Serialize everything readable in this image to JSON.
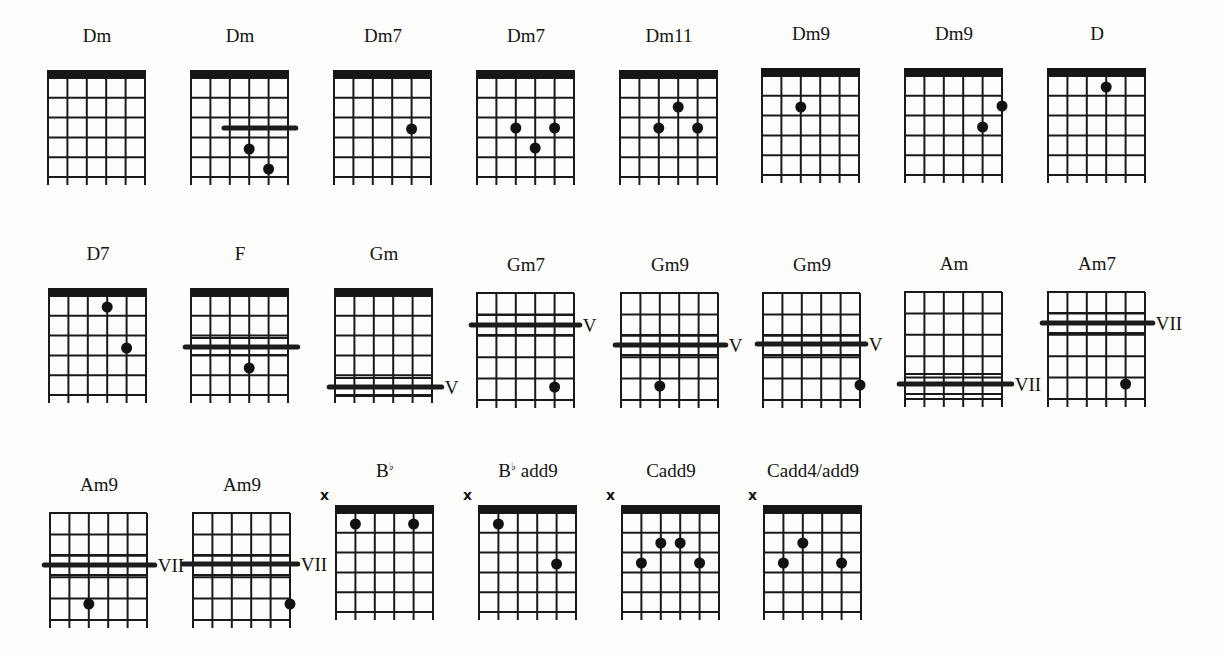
{
  "page": {
    "grid": {
      "width": 97,
      "height": 115,
      "strings": 6,
      "string_gap": 19.4,
      "fret_gap": 19.5,
      "nut_height": 8,
      "stub": 8
    }
  },
  "chords": [
    {
      "id": "dm-1",
      "name": "Dm",
      "x": 48,
      "y": 70,
      "nut": true,
      "mute": false,
      "dots": [],
      "barres": [],
      "extra_frets": []
    },
    {
      "id": "dm-2",
      "name": "Dm",
      "x": 191,
      "y": 70,
      "nut": true,
      "mute": false,
      "dots": [
        {
          "s": 3,
          "fy": 79
        },
        {
          "s": 4,
          "fy": 99
        }
      ],
      "barres": [
        {
          "fy": 58,
          "from": 1.7,
          "to": 5.4
        }
      ],
      "extra_frets": []
    },
    {
      "id": "dm7-1",
      "name": "Dm7",
      "x": 334,
      "y": 70,
      "nut": true,
      "mute": false,
      "dots": [
        {
          "s": 4,
          "fy": 59
        }
      ],
      "barres": [],
      "extra_frets": []
    },
    {
      "id": "dm7-2",
      "name": "Dm7",
      "x": 477,
      "y": 70,
      "nut": true,
      "mute": false,
      "dots": [
        {
          "s": 2,
          "fy": 58
        },
        {
          "s": 3,
          "fy": 78
        },
        {
          "s": 4,
          "fy": 58
        }
      ],
      "barres": [],
      "extra_frets": []
    },
    {
      "id": "dm11",
      "name": "Dm11",
      "x": 620,
      "y": 70,
      "nut": true,
      "mute": false,
      "dots": [
        {
          "s": 2,
          "fy": 58
        },
        {
          "s": 3,
          "fy": 37
        },
        {
          "s": 4,
          "fy": 58
        }
      ],
      "barres": [],
      "extra_frets": []
    },
    {
      "id": "dm9-1",
      "name": "Dm9",
      "x": 762,
      "y": 68,
      "nut": true,
      "mute": false,
      "dots": [
        {
          "s": 2,
          "fy": 39
        }
      ],
      "barres": [],
      "extra_frets": []
    },
    {
      "id": "dm9-2",
      "name": "Dm9",
      "x": 905,
      "y": 68,
      "nut": true,
      "mute": false,
      "dots": [
        {
          "s": 4,
          "fy": 59
        },
        {
          "s": 5,
          "fy": 38
        }
      ],
      "barres": [],
      "extra_frets": []
    },
    {
      "id": "d",
      "name": "D",
      "x": 1048,
      "y": 68,
      "nut": true,
      "mute": false,
      "dots": [
        {
          "s": 3,
          "fy": 19
        }
      ],
      "barres": [],
      "extra_frets": []
    },
    {
      "id": "d7",
      "name": "D7",
      "x": 49,
      "y": 288,
      "nut": true,
      "mute": false,
      "dots": [
        {
          "s": 3,
          "fy": 19
        },
        {
          "s": 4,
          "fy": 60
        }
      ],
      "barres": [],
      "extra_frets": []
    },
    {
      "id": "f",
      "name": "F",
      "x": 191,
      "y": 288,
      "nut": true,
      "mute": false,
      "dots": [
        {
          "s": 3,
          "fy": 80
        }
      ],
      "barres": [
        {
          "fy": 59,
          "from": -0.3,
          "to": 5.5
        }
      ],
      "extra_frets": [
        50,
        67
      ],
      "no_frets": [
        58.5
      ]
    },
    {
      "id": "gm",
      "name": "Gm",
      "x": 335,
      "y": 288,
      "nut": true,
      "mute": false,
      "dots": [],
      "barres": [
        {
          "fy": 99,
          "from": -0.3,
          "to": 5.5
        }
      ],
      "extra_frets": [
        90,
        108
      ],
      "no_frets": [],
      "position": {
        "label": "V",
        "fy": 99
      }
    },
    {
      "id": "gm7",
      "name": "Gm7",
      "x": 477,
      "y": 293,
      "nut": false,
      "mute": false,
      "dots": [
        {
          "s": 4,
          "fy": 94
        }
      ],
      "barres": [
        {
          "fy": 32,
          "from": -0.3,
          "to": 5.3
        }
      ],
      "extra_frets": [
        22,
        42
      ],
      "no_frets": [],
      "position": {
        "label": "V",
        "fy": 32
      }
    },
    {
      "id": "gm9-1",
      "name": "Gm9",
      "x": 621,
      "y": 293,
      "nut": false,
      "mute": false,
      "dots": [
        {
          "s": 2,
          "fy": 93
        }
      ],
      "barres": [
        {
          "fy": 52,
          "from": -0.3,
          "to": 5.4
        }
      ],
      "extra_frets": [
        42,
        62
      ],
      "no_frets": [],
      "position": {
        "label": "V",
        "fy": 52
      }
    },
    {
      "id": "gm9-2",
      "name": "Gm9",
      "x": 763,
      "y": 293,
      "nut": false,
      "mute": false,
      "dots": [
        {
          "s": 5,
          "fy": 92
        }
      ],
      "barres": [
        {
          "fy": 51,
          "from": -0.3,
          "to": 5.3
        }
      ],
      "extra_frets": [
        42,
        62
      ],
      "no_frets": [],
      "position": {
        "label": "V",
        "fy": 51
      }
    },
    {
      "id": "am",
      "name": "Am",
      "x": 905,
      "y": 292,
      "nut": false,
      "mute": false,
      "dots": [],
      "barres": [
        {
          "fy": 92,
          "from": -0.3,
          "to": 5.5
        }
      ],
      "extra_frets": [
        82,
        102
      ],
      "no_frets": [],
      "position": {
        "label": "VII",
        "fy": 92
      }
    },
    {
      "id": "am7",
      "name": "Am7",
      "x": 1048,
      "y": 292,
      "nut": false,
      "mute": false,
      "dots": [
        {
          "s": 4,
          "fy": 92
        }
      ],
      "barres": [
        {
          "fy": 31,
          "from": -0.3,
          "to": 5.4
        }
      ],
      "extra_frets": [
        21,
        41
      ],
      "no_frets": [],
      "position": {
        "label": "VII",
        "fy": 31
      }
    },
    {
      "id": "am9-1",
      "name": "Am9",
      "x": 50,
      "y": 513,
      "nut": false,
      "mute": false,
      "dots": [
        {
          "s": 2,
          "fy": 91
        }
      ],
      "barres": [
        {
          "fy": 52,
          "from": -0.3,
          "to": 5.4
        }
      ],
      "extra_frets": [
        42,
        62
      ],
      "no_frets": [],
      "position": {
        "label": "VII",
        "fy": 52
      }
    },
    {
      "id": "am9-2",
      "name": "Am9",
      "x": 193,
      "y": 513,
      "nut": false,
      "mute": false,
      "dots": [
        {
          "s": 5,
          "fy": 91
        }
      ],
      "barres": [
        {
          "fy": 51,
          "from": -0.5,
          "to": 5.4
        }
      ],
      "extra_frets": [
        42,
        62
      ],
      "no_frets": [],
      "position": {
        "label": "VII",
        "fy": 51
      }
    },
    {
      "id": "bb",
      "name": "B",
      "accidental": "♭",
      "suffix": "",
      "x": 336,
      "y": 505,
      "nut": true,
      "mute": true,
      "dots": [
        {
          "s": 1,
          "fy": 19
        },
        {
          "s": 4,
          "fy": 19
        }
      ],
      "barres": [],
      "extra_frets": []
    },
    {
      "id": "bb-add9",
      "name": "B",
      "accidental": "♭",
      "suffix": " add9",
      "x": 479,
      "y": 505,
      "nut": true,
      "mute": true,
      "dots": [
        {
          "s": 1,
          "fy": 19
        },
        {
          "s": 4,
          "fy": 59
        }
      ],
      "barres": [],
      "extra_frets": []
    },
    {
      "id": "cadd9",
      "name": "Cadd9",
      "x": 622,
      "y": 505,
      "nut": true,
      "mute": true,
      "dots": [
        {
          "s": 1,
          "fy": 58
        },
        {
          "s": 2,
          "fy": 38
        },
        {
          "s": 3,
          "fy": 38
        },
        {
          "s": 4,
          "fy": 58
        }
      ],
      "barres": [],
      "extra_frets": []
    },
    {
      "id": "cadd4-add9",
      "name": "Cadd4/add9",
      "x": 764,
      "y": 505,
      "nut": true,
      "mute": true,
      "dots": [
        {
          "s": 1,
          "fy": 58
        },
        {
          "s": 2,
          "fy": 38
        },
        {
          "s": 4,
          "fy": 58
        }
      ],
      "barres": [],
      "extra_frets": []
    }
  ],
  "chart_data": {
    "type": "table",
    "rows": [
      [
        "Dm",
        "Dm",
        "Dm7",
        "Dm7",
        "Dm11",
        "Dm9",
        "Dm9",
        "D"
      ],
      [
        "D7",
        "F",
        "Gm (V)",
        "Gm7 (V)",
        "Gm9 (V)",
        "Gm9 (V)",
        "Am (VII)",
        "Am7 (VII)"
      ],
      [
        "Am9 (VII)",
        "Am9 (VII)",
        "B♭",
        "B♭ add9",
        "Cadd9",
        "Cadd4/add9"
      ]
    ]
  }
}
